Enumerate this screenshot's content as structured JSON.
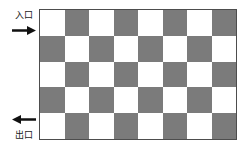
{
  "figure": {
    "colors": {
      "dark_cell": "#7b7b7b",
      "light_cell": "#ffffff",
      "border": "#4d4d4d",
      "text": "#1a1a1a"
    }
  },
  "entrance": {
    "label": "入口",
    "arrow_direction": "right",
    "arrow_glyph": "➤"
  },
  "exit": {
    "label": "出口",
    "arrow_direction": "left",
    "arrow_glyph": "➤"
  },
  "chart_data": {
    "type": "heatmap",
    "title": "",
    "xlabel": "",
    "ylabel": "",
    "columns": 8,
    "rows": 5,
    "legend": [],
    "annotations": [
      {
        "text": "入口",
        "position": "top-left-outside",
        "arrow": "right"
      },
      {
        "text": "出口",
        "position": "bottom-left-outside",
        "arrow": "left"
      }
    ],
    "values": [
      [
        0,
        1,
        0,
        1,
        0,
        1,
        0,
        1
      ],
      [
        1,
        0,
        1,
        0,
        1,
        0,
        1,
        0
      ],
      [
        0,
        1,
        0,
        1,
        0,
        1,
        0,
        1
      ],
      [
        1,
        0,
        1,
        0,
        1,
        0,
        1,
        0
      ],
      [
        0,
        1,
        0,
        1,
        0,
        1,
        0,
        1
      ]
    ],
    "value_legend": {
      "0": "light",
      "1": "dark"
    }
  }
}
